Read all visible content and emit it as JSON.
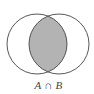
{
  "diagram": {
    "type": "venn",
    "sets": [
      {
        "name": "A",
        "cx": 37,
        "cy": 44,
        "r": 30
      },
      {
        "name": "B",
        "cx": 59,
        "cy": 44,
        "r": 30
      }
    ],
    "highlighted_region": "intersection",
    "label": "A ∩ B",
    "colors": {
      "background": "#ffffff",
      "stroke": "#444444",
      "fill": "#b3b3b3",
      "label": "#444444"
    }
  }
}
